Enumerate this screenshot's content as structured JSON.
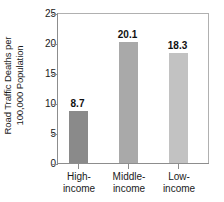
{
  "chart_data": {
    "type": "bar",
    "title": "",
    "subtitle": "",
    "xlabel": "",
    "ylabel": "Road Traffic Deaths per 100,000 Population",
    "ylabel_lines": [
      "Road Traffic Deaths per",
      "100,000 Population"
    ],
    "categories": [
      "High-income",
      "Middle-income",
      "Low-income"
    ],
    "category_lines": [
      [
        "High-",
        "income"
      ],
      [
        "Middle-",
        "income"
      ],
      [
        "Low-",
        "income"
      ]
    ],
    "values": [
      8.7,
      20.1,
      18.3
    ],
    "value_labels": [
      "8.7",
      "20.1",
      "18.3"
    ],
    "bar_colors": [
      "#8a8a8a",
      "#a9a9a9",
      "#c2c2c2"
    ],
    "ylim": [
      0,
      25
    ],
    "yticks": [
      0,
      5,
      10,
      15,
      20,
      25
    ],
    "ytick_labels": [
      "0",
      "5",
      "10",
      "15",
      "20",
      "25"
    ],
    "grid": false,
    "legend": false,
    "legend_position": "none",
    "axis_color": "#8d8d8d",
    "frame_color": "#b0b0b0",
    "background": "#ffffff"
  }
}
